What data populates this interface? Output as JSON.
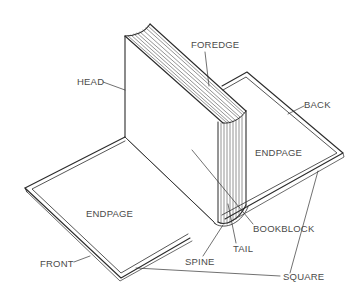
{
  "diagram": {
    "colors": {
      "ink": "#2b2b2b",
      "label": "#4a4a4a",
      "background": "#ffffff"
    },
    "labels": {
      "head": "HEAD",
      "foredge": "FOREDGE",
      "back": "BACK",
      "endpage_right": "ENDPAGE",
      "endpage_left": "ENDPAGE",
      "bookblock": "BOOKBLOCK",
      "tail": "TAIL",
      "spine": "SPINE",
      "front": "FRONT",
      "square": "SQUARE"
    }
  }
}
